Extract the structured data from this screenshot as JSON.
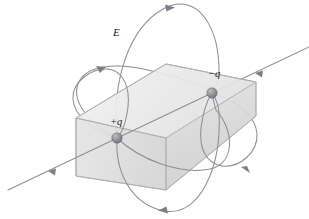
{
  "figure": {
    "type": "physics-diagram",
    "width": 309,
    "height": 219,
    "background_color": "#ffffff",
    "labels": {
      "field": "E",
      "positive_charge": "+q",
      "negative_charge": "−q"
    },
    "colors": {
      "field_line": "#8a8a94",
      "axis_line": "#8a8a94",
      "box_front_face": "#d9d9d9",
      "box_top_face": "#ebebeb",
      "box_left_face": "#e2e2e2",
      "box_right_face": "#cfcfcf",
      "box_edge": "#b4b4b4",
      "charge_sphere": "#8e8e96",
      "label_text": "#1a1a1a"
    },
    "box": {
      "name": "rectangular-gaussian-surface",
      "description": "Translucent gray rectangular box (parallelepiped) drawn in oblique projection enclosing the dipole",
      "front_face_points": "76,118 76,176 166,190 256,116 256,82 166,138",
      "top_face_points": "76,118 166,64 256,82 166,138",
      "left_face_points": "76,118 76,176 166,190 166,138",
      "right_face_points": "166,138 166,190 256,116 256,82"
    },
    "charges": [
      {
        "name": "positive-charge",
        "label": "+q",
        "cx": 117,
        "cy": 138,
        "r": 5.2
      },
      {
        "name": "negative-charge",
        "label": "−q",
        "cx": 212,
        "cy": 93,
        "r": 5.2
      }
    ],
    "axis_line": {
      "name": "dipole-axis-line",
      "description": "Straight field line along the dipole axis running from upper right off-screen to lower left off-screen, with arrowheads pointing toward the negative charge direction",
      "x1": 309,
      "y1": 47,
      "x2": 8,
      "y2": 190,
      "arrowheads": [
        {
          "x": 255,
          "y": 73,
          "angle": 205
        },
        {
          "x": 48,
          "y": 171,
          "angle": 205
        }
      ]
    },
    "field_lines": [
      {
        "name": "field-line-large-vertical-loop",
        "description": "Large near-vertical ellipse loop from +q to -q passing above and below the box",
        "arrowheads": [
          {
            "x": 167,
            "y": 8,
            "direction": "right"
          },
          {
            "x": 166,
            "y": 211,
            "direction": "left"
          }
        ]
      },
      {
        "name": "field-line-left-loop",
        "description": "Smaller tilted ellipse loop to the left of the box",
        "arrowheads": [
          {
            "x": 100,
            "y": 70,
            "direction": "right"
          }
        ]
      },
      {
        "name": "field-line-right-loop",
        "description": "Smaller tilted ellipse loop to the right / below the box",
        "arrowheads": [
          {
            "x": 246,
            "y": 172,
            "direction": "left"
          }
        ]
      },
      {
        "name": "field-line-wide-tilted-loop",
        "description": "Wide tilted ellipse loop sweeping through both charges",
        "arrowheads": []
      }
    ]
  }
}
